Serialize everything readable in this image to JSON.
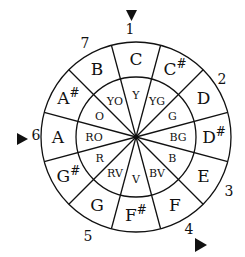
{
  "diagram": {
    "type": "circular note-color wheel",
    "segments": [
      {
        "note": "C",
        "sharp": "",
        "color": "Y"
      },
      {
        "note": "C",
        "sharp": "#",
        "color": "YG"
      },
      {
        "note": "D",
        "sharp": "",
        "color": "G"
      },
      {
        "note": "D",
        "sharp": "#",
        "color": "BG"
      },
      {
        "note": "E",
        "sharp": "",
        "color": "B"
      },
      {
        "note": "F",
        "sharp": "",
        "color": "BV"
      },
      {
        "note": "F",
        "sharp": "#",
        "color": "V"
      },
      {
        "note": "G",
        "sharp": "",
        "color": "RV"
      },
      {
        "note": "G",
        "sharp": "#",
        "color": "R"
      },
      {
        "note": "A",
        "sharp": "",
        "color": "RO"
      },
      {
        "note": "A",
        "sharp": "#",
        "color": "O"
      },
      {
        "note": "B",
        "sharp": "",
        "color": "YO"
      }
    ],
    "outer_numbers": [
      {
        "label": "1",
        "x": 130,
        "y": 34
      },
      {
        "label": "2",
        "x": 222,
        "y": 84
      },
      {
        "label": "3",
        "x": 229,
        "y": 196
      },
      {
        "label": "4",
        "x": 189,
        "y": 234
      },
      {
        "label": "5",
        "x": 88,
        "y": 241
      },
      {
        "label": "6",
        "x": 36,
        "y": 140
      },
      {
        "label": "7",
        "x": 85,
        "y": 48
      }
    ],
    "markers": [
      {
        "name": "marker-top",
        "direction": "down",
        "position": "1"
      },
      {
        "name": "marker-left",
        "direction": "right",
        "position": "6"
      },
      {
        "name": "marker-bottom-right",
        "direction": "right",
        "position": "4"
      }
    ]
  }
}
